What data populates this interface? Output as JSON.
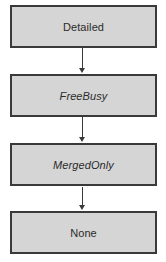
{
  "diagram": {
    "type": "flowchart",
    "orientation": "vertical-top-to-bottom",
    "background_color": "#ffffff",
    "node_fill_color": "#d5d5d5",
    "node_border_color": "#3a3a3a",
    "text_color": "#2b2b2b",
    "connector_color": "#3a3a3a",
    "nodes": [
      {
        "id": "detailed",
        "label": "Detailed",
        "style": "normal"
      },
      {
        "id": "freebusy",
        "label": "FreeBusy",
        "style": "italic"
      },
      {
        "id": "mergedonly",
        "label": "MergedOnly",
        "style": "italic"
      },
      {
        "id": "none",
        "label": "None",
        "style": "normal"
      }
    ],
    "connectors": [
      {
        "id": "connector-1",
        "from": "detailed",
        "to": "freebusy",
        "arrowhead": "solid-triangle-down"
      },
      {
        "id": "connector-2",
        "from": "freebusy",
        "to": "mergedonly",
        "arrowhead": "solid-triangle-down"
      },
      {
        "id": "connector-3",
        "from": "mergedonly",
        "to": "none",
        "arrowhead": "solid-triangle-down"
      }
    ]
  }
}
